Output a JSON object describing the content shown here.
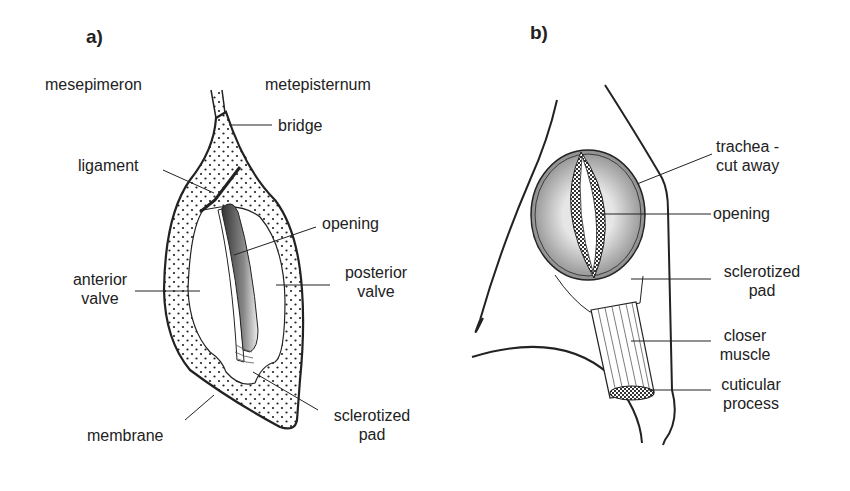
{
  "figure": {
    "panels": [
      {
        "tag": "a)",
        "labels": {
          "mesepimeron": "mesepimeron",
          "metepisternum": "metepisternum",
          "bridge": "bridge",
          "ligament": "ligament",
          "opening": "opening",
          "anterior_valve_1": "anterior",
          "anterior_valve_2": "valve",
          "posterior_valve_1": "posterior",
          "posterior_valve_2": "valve",
          "membrane": "membrane",
          "sclerotized_pad_1": "sclerotized",
          "sclerotized_pad_2": "pad"
        }
      },
      {
        "tag": "b)",
        "labels": {
          "trachea_1": "trachea -",
          "trachea_2": "cut away",
          "opening": "opening",
          "sclerotized_pad_1": "sclerotized",
          "sclerotized_pad_2": "pad",
          "closer_muscle_1": "closer",
          "closer_muscle_2": "muscle",
          "cuticular_process_1": "cuticular",
          "cuticular_process_2": "process"
        }
      }
    ],
    "colors": {
      "ink": "#222222",
      "background": "#ffffff",
      "shade_dark": "#555555",
      "shade_light": "#e8e8e8"
    }
  }
}
